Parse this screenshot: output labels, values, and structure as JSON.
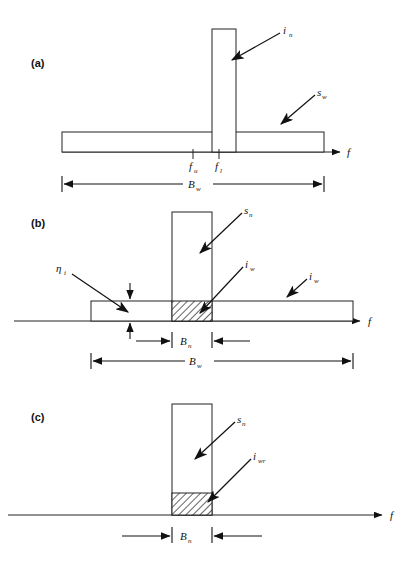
{
  "figure": {
    "title_present": false,
    "background": "#ffffff",
    "ink": "#1a1a1a",
    "panels": [
      {
        "id": "a",
        "label": "(a)",
        "axis_label": "f",
        "tick_labels": [
          "f",
          "f"
        ],
        "tick_subscripts": [
          "u",
          "l"
        ],
        "annotations": [
          {
            "name": "interference-narrowband",
            "symbol": "i",
            "subscript": "n"
          },
          {
            "name": "signal-wideband",
            "symbol": "s",
            "subscript": "w"
          }
        ],
        "dimensions": [
          {
            "name": "bandwidth-wide",
            "symbol": "B",
            "subscript": "w"
          }
        ]
      },
      {
        "id": "b",
        "label": "(b)",
        "axis_label": "f",
        "annotations": [
          {
            "name": "efficiency",
            "symbol": "η",
            "subscript": "i"
          },
          {
            "name": "signal-narrowband",
            "symbol": "s",
            "subscript": "n"
          },
          {
            "name": "interference-overlap",
            "symbol": "i",
            "subscript": "w"
          },
          {
            "name": "interference-wideband",
            "symbol": "i",
            "subscript": "w"
          }
        ],
        "dimensions": [
          {
            "name": "bandwidth-narrow",
            "symbol": "B",
            "subscript": "n"
          },
          {
            "name": "bandwidth-wide",
            "symbol": "B",
            "subscript": "w"
          }
        ]
      },
      {
        "id": "c",
        "label": "(c)",
        "axis_label": "f",
        "annotations": [
          {
            "name": "signal-narrowband",
            "symbol": "s",
            "subscript": "n"
          },
          {
            "name": "interference-residual",
            "symbol": "i",
            "subscript": "wr"
          }
        ],
        "dimensions": [
          {
            "name": "bandwidth-narrow",
            "symbol": "B",
            "subscript": "n"
          }
        ]
      }
    ]
  }
}
